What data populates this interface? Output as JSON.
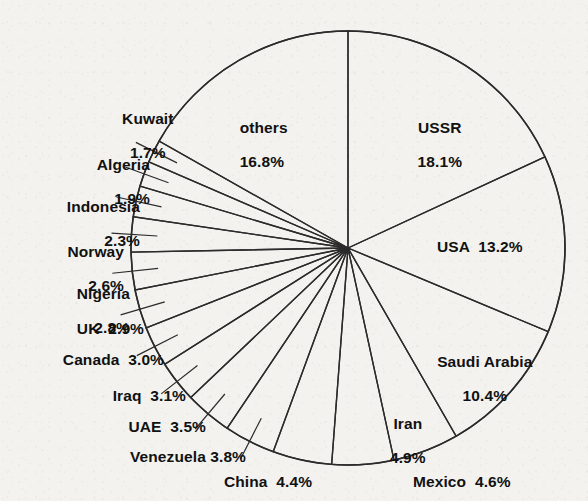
{
  "figure": {
    "header_fragment": "Oil",
    "background_color": "#f3f2ef",
    "line_color": "#2b2b2b",
    "text_color": "#111111"
  },
  "chart_data": {
    "type": "pie",
    "title": "",
    "start_angle_deg": 0,
    "direction": "clockwise",
    "units": "percent",
    "total": 100.0,
    "categories": [
      "USSR",
      "USA",
      "Saudi Arabia",
      "Iran",
      "Mexico",
      "China",
      "Venezuela",
      "UAE",
      "Iraq",
      "Canada",
      "UK",
      "Nigeria",
      "Norway",
      "Indonesia",
      "Algeria",
      "Kuwait",
      "others"
    ],
    "values": [
      18.1,
      13.2,
      10.4,
      4.9,
      4.6,
      4.4,
      3.8,
      3.5,
      3.1,
      3.0,
      2.9,
      2.8,
      2.6,
      2.3,
      1.9,
      1.7,
      16.8
    ],
    "labels": [
      {
        "name": "USSR",
        "value": 18.1,
        "text": "18.1%",
        "placement": "inside"
      },
      {
        "name": "USA",
        "value": 13.2,
        "text": "13.2%",
        "placement": "inside"
      },
      {
        "name": "Saudi Arabia",
        "value": 10.4,
        "text": "10.4%",
        "placement": "inside"
      },
      {
        "name": "Iran",
        "value": 4.9,
        "text": "4.9%",
        "placement": "inside"
      },
      {
        "name": "Mexico",
        "value": 4.6,
        "text": "4.6%",
        "placement": "outside"
      },
      {
        "name": "China",
        "value": 4.4,
        "text": "4.4%",
        "placement": "outside"
      },
      {
        "name": "Venezuela",
        "value": 3.8,
        "text": "3.8%",
        "placement": "outside"
      },
      {
        "name": "UAE",
        "value": 3.5,
        "text": "3.5%",
        "placement": "outside"
      },
      {
        "name": "Iraq",
        "value": 3.1,
        "text": "3.1%",
        "placement": "outside"
      },
      {
        "name": "Canada",
        "value": 3.0,
        "text": "3.0%",
        "placement": "outside"
      },
      {
        "name": "UK",
        "value": 2.9,
        "text": "2.9%",
        "placement": "outside"
      },
      {
        "name": "Nigeria",
        "value": 2.8,
        "text": "2.8%",
        "placement": "outside"
      },
      {
        "name": "Norway",
        "value": 2.6,
        "text": "2.6%",
        "placement": "outside"
      },
      {
        "name": "Indonesia",
        "value": 2.3,
        "text": "2.3%",
        "placement": "outside"
      },
      {
        "name": "Algeria",
        "value": 1.9,
        "text": "1.9%",
        "placement": "outside"
      },
      {
        "name": "Kuwait",
        "value": 1.7,
        "text": "1.7%",
        "placement": "outside"
      },
      {
        "name": "others",
        "value": 16.8,
        "text": "16.8%",
        "placement": "inside"
      }
    ],
    "legend": "none",
    "grid": false
  },
  "labels_text": {
    "ussr_l1": "USSR",
    "ussr_l2": "18.1%",
    "others_l1": "others",
    "others_l2": "16.8%",
    "usa": "USA  13.2%",
    "saudi_l1": "Saudi Arabia",
    "saudi_l2": "10.4%",
    "iran_l1": "Iran",
    "iran_l2": "4.9%",
    "mexico": "Mexico  4.6%",
    "china": "China  4.4%",
    "venezuela": "Venezuela 3.8%",
    "uae": "UAE  3.5%",
    "iraq": "Iraq  3.1%",
    "canada": "Canada  3.0%",
    "uk": "UK  2.9%",
    "nigeria_l1": "Nigeria",
    "nigeria_l2": "2.8%",
    "norway_l1": "Norway",
    "norway_l2": "2.6%",
    "indonesia_l1": "Indonesia",
    "indonesia_l2": "2.3%",
    "algeria_l1": "Algeria",
    "algeria_l2": "1.9%",
    "kuwait_l1": "Kuwait",
    "kuwait_l2": "1.7%"
  }
}
